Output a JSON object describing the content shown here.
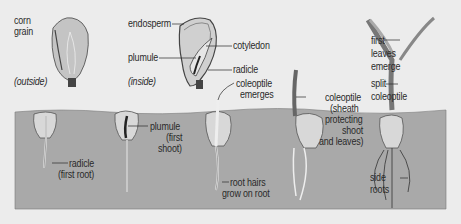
{
  "diagram": {
    "title_implied": "Corn seed germination stages",
    "colors": {
      "background": "#ececec",
      "soil": "#a9a9a9",
      "seed_fill": "#c9c9c9",
      "seed_dark": "#555555",
      "line": "#2a2a2a"
    },
    "above_ground": {
      "outside": {
        "name_label": "corn\ngrain",
        "view_label": "(outside)"
      },
      "inside": {
        "view_label": "(inside)",
        "labels": {
          "endosperm": "endosperm",
          "cotyledon": "cotyledon",
          "plumule": "plumule",
          "radicle": "radicle"
        }
      }
    },
    "stages": [
      {
        "id": "stage-1",
        "label_line1": "radicle",
        "label_line2": "(first root)"
      },
      {
        "id": "stage-2",
        "label_line1": "plumule",
        "label_line2": "(first",
        "label_line3": "shoot)"
      },
      {
        "id": "stage-3",
        "label_top_line1": "coleoptile",
        "label_top_line2": "emerges",
        "label_line1": "root hairs",
        "label_line2": "grow on root"
      },
      {
        "id": "stage-4",
        "label_line1": "coleoptile",
        "label_line2": "(sheath",
        "label_line3": "protecting",
        "label_line4": "shoot",
        "label_line5": "and leaves)"
      },
      {
        "id": "stage-5",
        "label_leaves_1": "first",
        "label_leaves_2": "leaves",
        "label_leaves_3": "emerge",
        "label_split_1": "split",
        "label_split_2": "coleoptile",
        "label_roots_1": "side",
        "label_roots_2": "roots"
      }
    ]
  }
}
